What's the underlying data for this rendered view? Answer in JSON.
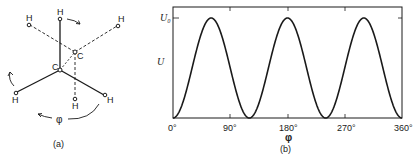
{
  "figure_a": {
    "caption": "(a)",
    "atoms": {
      "carbon_front": "C",
      "carbon_back": "C",
      "hydrogen": "H"
    },
    "angle_label": "φ"
  },
  "figure_b": {
    "caption": "(b)"
  },
  "chart_data": {
    "type": "line",
    "title": "",
    "xlabel": "φ",
    "ylabel": "U",
    "xlim": [
      0,
      360
    ],
    "ylim": [
      0,
      1
    ],
    "x_ticks": [
      "0°",
      "90°",
      "180°",
      "270°",
      "360°"
    ],
    "y_ticks": [
      "U₀"
    ],
    "grid": false,
    "legend": null,
    "series": [
      {
        "name": "U(φ)",
        "formula": "U = (U₀/2)(1 − cos 3φ)",
        "x": [
          0,
          30,
          60,
          90,
          120,
          150,
          180,
          210,
          240,
          270,
          300,
          330,
          360
        ],
        "values": [
          0,
          0.5,
          1,
          0.5,
          0,
          0.5,
          1,
          0.5,
          0,
          0.5,
          1,
          0.5,
          0
        ]
      }
    ],
    "annotations": {
      "maxima_at": [
        60,
        180,
        300
      ],
      "minima_at": [
        0,
        120,
        240,
        360
      ],
      "max_label": "U₀"
    }
  }
}
